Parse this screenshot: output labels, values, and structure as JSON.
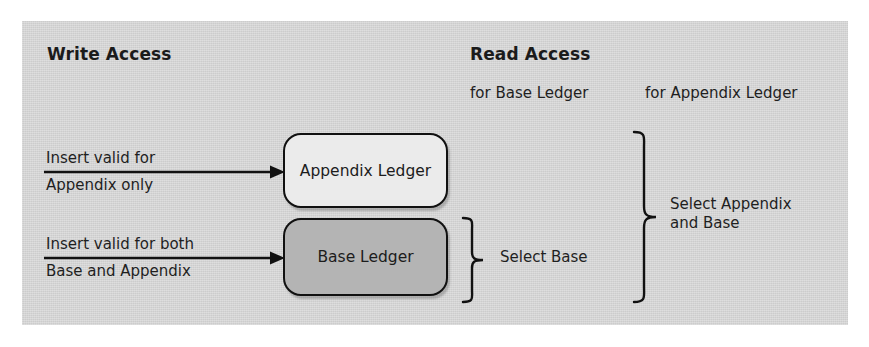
{
  "figure": {
    "panel_color": "#d4d4d4",
    "write_column": {
      "heading": "Write Access",
      "arrows": [
        {
          "name": "insert-appendix-only",
          "label_top": "Insert valid for",
          "label_bottom": "Appendix only",
          "target": "Appendix Ledger"
        },
        {
          "name": "insert-base-and-appendix",
          "label_top": "Insert valid for both",
          "label_bottom": "Base and Appendix",
          "target": "Base Ledger"
        }
      ]
    },
    "ledgers": [
      {
        "name": "appendix-ledger",
        "label": "Appendix Ledger",
        "fill": "#ebebeb"
      },
      {
        "name": "base-ledger",
        "label": "Base Ledger",
        "fill": "#b4b4b4"
      }
    ],
    "read_column": {
      "heading": "Read Access",
      "subheading_base": "for Base Ledger",
      "subheading_appendix": "for Appendix Ledger",
      "brace_base_label": "Select Base",
      "brace_appendix_label": "Select Appendix\nand Base"
    }
  }
}
